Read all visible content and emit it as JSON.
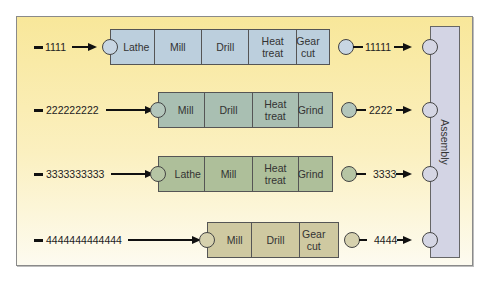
{
  "diagram": {
    "colors": {
      "panel_bg": "#f8e79a",
      "row1_fill": "#bccfdd",
      "row2_fill": "#a9bfb2",
      "row3_fill": "#aebf9a",
      "row4_fill": "#cfc9a1",
      "assembly_fill": "#d3d4e4"
    },
    "assembly": {
      "label": "Assembly"
    },
    "rows": [
      {
        "input_label": "1111",
        "output_label": "11111",
        "operations": [
          "Lathe",
          "Mill",
          "Drill",
          "Heat treat",
          "Gear cut"
        ]
      },
      {
        "input_label": "222222222",
        "output_label": "2222",
        "operations": [
          "Mill",
          "Drill",
          "Heat treat",
          "Grind"
        ]
      },
      {
        "input_label": "3333333333",
        "output_label": "3333",
        "operations": [
          "Lathe",
          "Mill",
          "Heat treat",
          "Grind"
        ]
      },
      {
        "input_label": "4444444444444",
        "output_label": "4444",
        "operations": [
          "Mill",
          "Drill",
          "Gear cut"
        ]
      }
    ]
  }
}
